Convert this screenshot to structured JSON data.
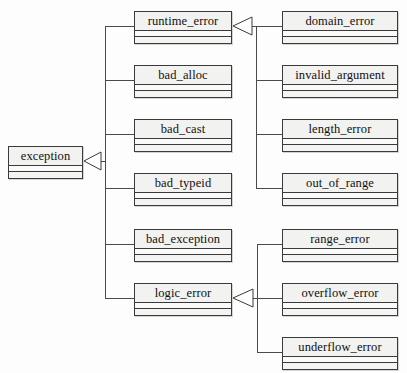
{
  "diagram": {
    "type": "uml-class-diagram",
    "notation": "UML generalization (hollow triangle arrowhead points to base class)",
    "canvas": {
      "width": 407,
      "height": 373
    },
    "colors": {
      "background": "#fdfdfd",
      "box_fill": "#f7f7f5",
      "box_header_fill": "#f2f2f0",
      "border": "#3a3a3a",
      "line": "#4a4a4a",
      "text": "#101010"
    },
    "classes": [
      {
        "id": "exception",
        "label": "exception",
        "x": 8,
        "y": 146,
        "w": 75,
        "column": "left"
      },
      {
        "id": "runtime_error",
        "label": "runtime_error",
        "x": 134,
        "y": 11,
        "w": 98,
        "column": "middle"
      },
      {
        "id": "bad_alloc",
        "label": "bad_alloc",
        "x": 134,
        "y": 65,
        "w": 98,
        "column": "middle"
      },
      {
        "id": "bad_cast",
        "label": "bad_cast",
        "x": 134,
        "y": 119,
        "w": 98,
        "column": "middle"
      },
      {
        "id": "bad_typeid",
        "label": "bad_typeid",
        "x": 134,
        "y": 173,
        "w": 98,
        "column": "middle"
      },
      {
        "id": "bad_exception",
        "label": "bad_exception",
        "x": 134,
        "y": 229,
        "w": 98,
        "column": "middle"
      },
      {
        "id": "logic_error",
        "label": "logic_error",
        "x": 134,
        "y": 283,
        "w": 98,
        "column": "middle"
      },
      {
        "id": "domain_error",
        "label": "domain_error",
        "x": 282,
        "y": 11,
        "w": 116,
        "column": "right"
      },
      {
        "id": "invalid_argument",
        "label": "invalid_argument",
        "x": 282,
        "y": 65,
        "w": 116,
        "column": "right"
      },
      {
        "id": "length_error",
        "label": "length_error",
        "x": 282,
        "y": 119,
        "w": 116,
        "column": "right"
      },
      {
        "id": "out_of_range",
        "label": "out_of_range",
        "x": 282,
        "y": 173,
        "w": 116,
        "column": "right"
      },
      {
        "id": "range_error",
        "label": "range_error",
        "x": 282,
        "y": 229,
        "w": 116,
        "column": "right"
      },
      {
        "id": "overflow_error",
        "label": "overflow_error",
        "x": 282,
        "y": 283,
        "w": 116,
        "column": "right"
      },
      {
        "id": "underflow_error",
        "label": "underflow_error",
        "x": 282,
        "y": 337,
        "w": 116,
        "column": "right"
      }
    ],
    "generalizations": [
      {
        "base": "exception",
        "derived": "runtime_error"
      },
      {
        "base": "exception",
        "derived": "bad_alloc"
      },
      {
        "base": "exception",
        "derived": "bad_cast"
      },
      {
        "base": "exception",
        "derived": "bad_typeid"
      },
      {
        "base": "exception",
        "derived": "bad_exception"
      },
      {
        "base": "exception",
        "derived": "logic_error"
      },
      {
        "base": "runtime_error",
        "derived": "domain_error"
      },
      {
        "base": "runtime_error",
        "derived": "invalid_argument"
      },
      {
        "base": "runtime_error",
        "derived": "length_error"
      },
      {
        "base": "runtime_error",
        "derived": "out_of_range"
      },
      {
        "base": "logic_error",
        "derived": "range_error"
      },
      {
        "base": "logic_error",
        "derived": "overflow_error"
      },
      {
        "base": "logic_error",
        "derived": "underflow_error"
      }
    ],
    "arrowheads": [
      {
        "id": "arrow-to-exception",
        "points_to": "exception",
        "tip_x": 84,
        "tip_y": 161,
        "base_x": 101,
        "half_height": 9
      },
      {
        "id": "arrow-to-runtime-error",
        "points_to": "runtime_error",
        "tip_x": 233,
        "tip_y": 26,
        "base_x": 252,
        "half_height": 9
      },
      {
        "id": "arrow-to-logic-error",
        "points_to": "logic_error",
        "tip_x": 233,
        "tip_y": 298,
        "base_x": 253,
        "half_height": 9
      }
    ],
    "trunks": [
      {
        "id": "trunk-exception",
        "x": 105,
        "y_top": 26,
        "y_bottom": 298
      },
      {
        "id": "trunk-runtime-error",
        "x": 256,
        "y_top": 26,
        "y_bottom": 188
      },
      {
        "id": "trunk-logic-error",
        "x": 257,
        "y_top": 244,
        "y_bottom": 352
      }
    ]
  }
}
